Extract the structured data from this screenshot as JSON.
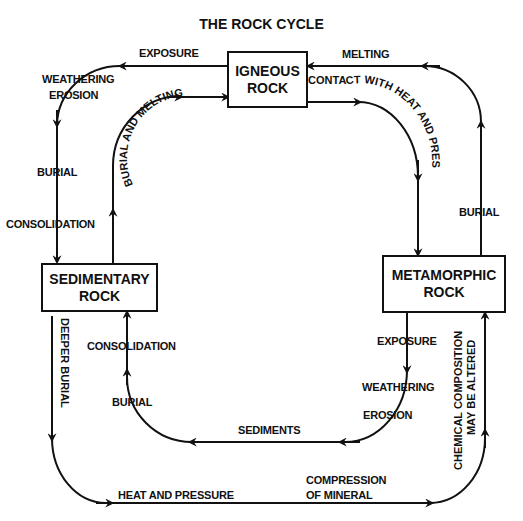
{
  "title": "THE ROCK CYCLE",
  "boxes": {
    "igneous": [
      "IGNEOUS",
      "ROCK"
    ],
    "sedimentary": [
      "SEDIMENTARY",
      "ROCK"
    ],
    "metamorphic": [
      "METAMORPHIC",
      "ROCK"
    ]
  },
  "labels": {
    "exposure_top": "EXPOSURE",
    "melting": "MELTING",
    "weathering_top": "WEATHERING",
    "erosion_top": "EROSION",
    "burial_left": "BURIAL",
    "consolidation_left": "CONSOLIDATION",
    "burial_and_melting": "BURIAL AND MELTING",
    "contact_heat_pressure": "CONTACT WITH HEAT AND PRESSURE",
    "burial_right": "BURIAL",
    "deeper_burial": "DEEPER BURIAL",
    "consolidation_inner": "CONSOLIDATION",
    "burial_inner": "BURIAL",
    "exposure_meta": "EXPOSURE",
    "weathering_meta": "WEATHERING",
    "erosion_meta": "EROSION",
    "sediments": "SEDIMENTS",
    "chemical_1": "CHEMICAL COMPOSITION",
    "chemical_2": "MAY BE ALTERED",
    "heat_and_pressure": "HEAT AND PRESSURE",
    "compression_1": "COMPRESSION",
    "compression_2": "OF MINERAL"
  }
}
